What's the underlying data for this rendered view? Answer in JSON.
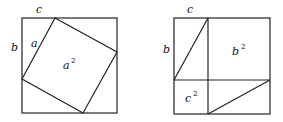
{
  "figure": {
    "left": {
      "labels": {
        "top": "c",
        "side_outer": "b",
        "side_inner": "a",
        "area_base": "a",
        "area_exp": "2"
      }
    },
    "right": {
      "labels": {
        "top": "c",
        "side": "b",
        "big_base": "b",
        "big_exp": "2",
        "small_base": "c",
        "small_exp": "2"
      }
    },
    "stroke_color": "#222222"
  }
}
